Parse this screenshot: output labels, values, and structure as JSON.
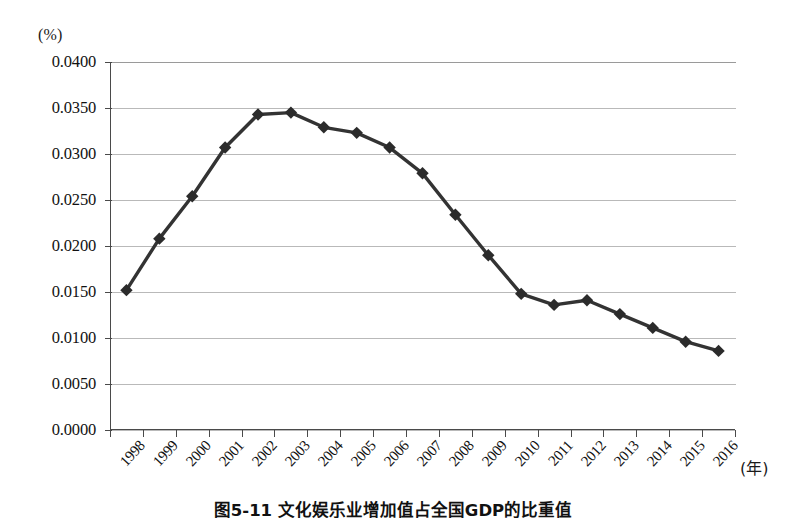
{
  "figure": {
    "caption": "图5-11 文化娱乐业增加值占全国GDP的比重值",
    "y_unit": "(%)",
    "x_unit": "(年)"
  },
  "chart_data": {
    "type": "line",
    "title": "图5-11 文化娱乐业增加值占全国GDP的比重值",
    "xlabel": "(年)",
    "ylabel": "(%)",
    "ylim": [
      0.0,
      0.04
    ],
    "ytick_step": 0.005,
    "grid": true,
    "legend": "none",
    "marker": "diamond",
    "line_color": "#333333",
    "marker_color": "#2b2b2b",
    "grid_color": "#b9b9b9",
    "axis_color": "#4a4a4a",
    "categories": [
      "1998",
      "1999",
      "2000",
      "2001",
      "2002",
      "2003",
      "2004",
      "2005",
      "2006",
      "2007",
      "2008",
      "2009",
      "2010",
      "2011",
      "2012",
      "2013",
      "2014",
      "2015",
      "2016"
    ],
    "ytick_labels": [
      "0.0000",
      "0.0050",
      "0.0100",
      "0.0150",
      "0.0200",
      "0.0250",
      "0.0300",
      "0.0350",
      "0.0400"
    ],
    "ytick_values": [
      0.0,
      0.005,
      0.01,
      0.015,
      0.02,
      0.025,
      0.03,
      0.035,
      0.04
    ],
    "values": [
      0.0152,
      0.0208,
      0.0254,
      0.0307,
      0.0343,
      0.0345,
      0.0329,
      0.0323,
      0.0307,
      0.0279,
      0.0234,
      0.019,
      0.0148,
      0.0136,
      0.0141,
      0.0126,
      0.0111,
      0.0096,
      0.0086
    ]
  }
}
